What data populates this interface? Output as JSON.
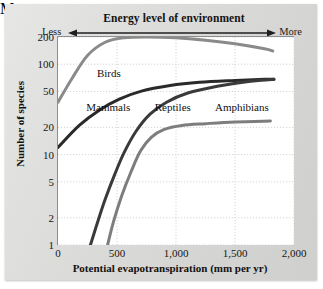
{
  "chart_data": {
    "type": "line",
    "title": "Energy level of environment",
    "header": {
      "left_label": "Less",
      "right_label": "More",
      "title": "Energy level of environment",
      "arrow": "double-headed-horizontal-arrow"
    },
    "xlabel": "Potential evapotranspiration (mm per yr)",
    "ylabel": "Number of species",
    "xlim": [
      0,
      2000
    ],
    "ylim": [
      1,
      200
    ],
    "yscale": "log",
    "xscale": "linear",
    "grid": true,
    "legend": "inline-series-labels",
    "xticks": [
      0,
      500,
      1000,
      1500,
      2000
    ],
    "xtick_labels": [
      "0",
      "500",
      "1,000",
      "1,500",
      "2,000"
    ],
    "yticks": [
      1,
      2,
      5,
      10,
      20,
      50,
      100,
      200
    ],
    "ytick_labels": [
      "1",
      "2",
      "5",
      "10",
      "20",
      "50",
      "100",
      "200"
    ],
    "series": [
      {
        "name": "Birds",
        "color": "#8a8a8a",
        "label_x": 330,
        "label_y": 78,
        "points": [
          [
            0,
            38
          ],
          [
            120,
            70
          ],
          [
            250,
            125
          ],
          [
            400,
            175
          ],
          [
            560,
            196
          ],
          [
            760,
            200
          ],
          [
            1000,
            196
          ],
          [
            1250,
            184
          ],
          [
            1500,
            168
          ],
          [
            1750,
            148
          ],
          [
            1820,
            140
          ]
        ]
      },
      {
        "name": "Mammals",
        "color": "#2a2a2a",
        "label_x": 240,
        "label_y": 33,
        "points": [
          [
            0,
            12
          ],
          [
            180,
            21
          ],
          [
            350,
            31
          ],
          [
            520,
            41
          ],
          [
            700,
            50
          ],
          [
            950,
            58
          ],
          [
            1200,
            63
          ],
          [
            1500,
            66
          ],
          [
            1750,
            68
          ],
          [
            1830,
            68
          ]
        ]
      },
      {
        "name": "Reptiles",
        "color": "#3a3a3a",
        "label_x": 820,
        "label_y": 33,
        "points": [
          [
            275,
            1
          ],
          [
            330,
            1.7
          ],
          [
            400,
            3.2
          ],
          [
            480,
            6
          ],
          [
            560,
            10.5
          ],
          [
            660,
            18
          ],
          [
            780,
            28
          ],
          [
            920,
            38
          ],
          [
            1100,
            48
          ],
          [
            1350,
            57
          ],
          [
            1600,
            64
          ],
          [
            1830,
            68
          ]
        ]
      },
      {
        "name": "Amphibians",
        "color": "#7d7d7d",
        "label_x": 1330,
        "label_y": 33,
        "points": [
          [
            420,
            1
          ],
          [
            470,
            1.8
          ],
          [
            540,
            3.5
          ],
          [
            620,
            6.5
          ],
          [
            700,
            11
          ],
          [
            790,
            15.5
          ],
          [
            900,
            19
          ],
          [
            1050,
            21
          ],
          [
            1250,
            22
          ],
          [
            1500,
            23
          ],
          [
            1800,
            23.5
          ]
        ]
      }
    ]
  }
}
